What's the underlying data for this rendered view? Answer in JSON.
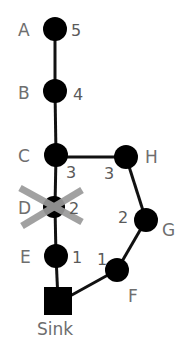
{
  "diagram": {
    "type": "network-graph",
    "nodes": [
      {
        "id": "A",
        "label": "A",
        "value": "5",
        "x": 55,
        "y": 29,
        "shape": "circle"
      },
      {
        "id": "B",
        "label": "B",
        "value": "4",
        "x": 55,
        "y": 91,
        "shape": "circle"
      },
      {
        "id": "C",
        "label": "C",
        "value": "3",
        "x": 56,
        "y": 155,
        "shape": "circle"
      },
      {
        "id": "H",
        "label": "H",
        "value": "3",
        "x": 126,
        "y": 157,
        "shape": "circle"
      },
      {
        "id": "D",
        "label": "D",
        "value": "2",
        "x": 53,
        "y": 207,
        "shape": "circle",
        "removed": true
      },
      {
        "id": "G",
        "label": "G",
        "value": "2",
        "x": 146,
        "y": 220,
        "shape": "circle"
      },
      {
        "id": "E",
        "label": "E",
        "value": "1",
        "x": 56,
        "y": 256,
        "shape": "circle"
      },
      {
        "id": "F",
        "label": "F",
        "value": "1",
        "x": 117,
        "y": 270,
        "shape": "circle"
      },
      {
        "id": "Sink",
        "label": "Sink",
        "x": 58,
        "y": 301,
        "shape": "square"
      }
    ],
    "edges": [
      [
        "A",
        "B"
      ],
      [
        "B",
        "C"
      ],
      [
        "C",
        "H"
      ],
      [
        "C",
        "D"
      ],
      [
        "D",
        "E"
      ],
      [
        "E",
        "Sink"
      ],
      [
        "H",
        "G"
      ],
      [
        "G",
        "F"
      ],
      [
        "F",
        "Sink"
      ]
    ],
    "colors": {
      "node": "#000000",
      "edge": "#111111",
      "label": "#6e6e6e",
      "cross": "#9a9a9a"
    }
  }
}
